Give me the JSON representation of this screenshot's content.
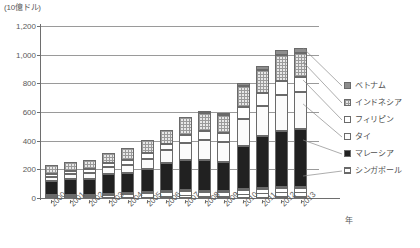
{
  "chart_data": {
    "type": "bar",
    "stacked": true,
    "title": "",
    "unit_caption": "(10億ドル)",
    "xlabel": "年",
    "ylabel": "",
    "ylim": [
      0,
      1200
    ],
    "ytick_labels": [
      "0",
      "200",
      "400",
      "600",
      "800",
      "1,000",
      "1,200"
    ],
    "ytick_values": [
      0,
      200,
      400,
      600,
      800,
      1000,
      1200
    ],
    "grid": true,
    "legend_position": "right",
    "categories": [
      "2000",
      "2001",
      "2002",
      "2003",
      "2004",
      "2005",
      "2006",
      "2007",
      "2008",
      "2009",
      "2010",
      "2011",
      "2012",
      "2013"
    ],
    "series": [
      {
        "name": "シンガポール",
        "pattern": "horizontal-stripes",
        "values": [
          20,
          22,
          24,
          28,
          34,
          40,
          48,
          55,
          52,
          48,
          62,
          72,
          78,
          80
        ]
      },
      {
        "name": "マレーシア",
        "pattern": "solid-black",
        "values": [
          100,
          108,
          110,
          142,
          140,
          160,
          196,
          208,
          210,
          200,
          300,
          360,
          388,
          400
        ]
      },
      {
        "name": "タイ",
        "pattern": "light-dots",
        "values": [
          30,
          36,
          42,
          48,
          56,
          72,
          90,
          122,
          140,
          142,
          190,
          210,
          250,
          258
        ]
      },
      {
        "name": "フィリピン",
        "pattern": "white",
        "values": [
          20,
          22,
          24,
          26,
          34,
          40,
          44,
          54,
          64,
          62,
          82,
          90,
          100,
          104
        ]
      },
      {
        "name": "インドネシア",
        "pattern": "checkered",
        "values": [
          62,
          64,
          68,
          70,
          84,
          92,
          100,
          128,
          130,
          128,
          150,
          160,
          180,
          170
        ]
      },
      {
        "name": "ベトナム",
        "pattern": "dark-gray",
        "values": [
          0,
          0,
          0,
          0,
          0,
          0,
          0,
          0,
          14,
          16,
          22,
          28,
          34,
          38
        ]
      }
    ],
    "totals": [
      232,
      252,
      268,
      314,
      348,
      404,
      478,
      567,
      610,
      596,
      806,
      920,
      1030,
      1050
    ],
    "colors": {
      "singapore": "#ffffff",
      "malaysia": "#212121",
      "thailand": "#fbfbfb",
      "philippines": "#ffffff",
      "indonesia": "#e8e8e8",
      "vietnam": "#8d8d8d",
      "axis": "#6e6e6e",
      "grid": "#9a9a9a",
      "text": "#4f4f4f"
    }
  }
}
